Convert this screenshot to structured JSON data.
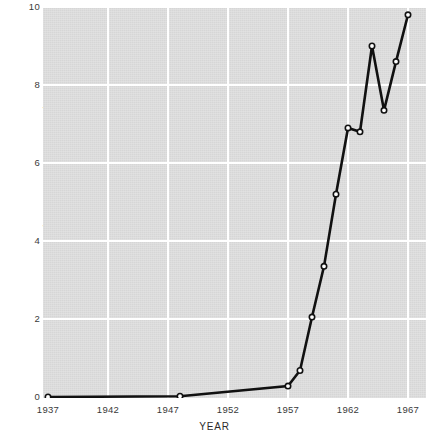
{
  "chart_data": {
    "type": "line",
    "title": "",
    "xlabel": "YEAR",
    "ylabel": "LIVE WEIGHT (MILLION METRIC TONS)",
    "xlim": [
      1937,
      1968
    ],
    "ylim": [
      0,
      10
    ],
    "xticks": [
      1937,
      1942,
      1947,
      1952,
      1957,
      1962,
      1967
    ],
    "xtick_labels": [
      "1937",
      "1942",
      "1947",
      "1952",
      "1957",
      "1962",
      "1967"
    ],
    "yticks": [
      0,
      2,
      4,
      6,
      8,
      10
    ],
    "ytick_labels": [
      "0",
      "2",
      "4",
      "6",
      "8",
      "10"
    ],
    "grid": true,
    "grid_color": "#ffffff",
    "plot_bg": "#dcdcdc",
    "line_color": "#111111",
    "marker": "open-circle",
    "marker_face_color": "#ffffff",
    "legend": "none",
    "x": [
      1937,
      1948,
      1957,
      1958,
      1959,
      1960,
      1961,
      1962,
      1963,
      1964,
      1965,
      1966,
      1967
    ],
    "values": [
      0.0,
      0.02,
      0.28,
      0.68,
      2.05,
      3.35,
      5.2,
      6.9,
      6.8,
      9.0,
      7.35,
      8.6,
      9.8
    ],
    "series": [
      {
        "name": "Live weight",
        "points": [
          {
            "x": 1937,
            "y": 0.0
          },
          {
            "x": 1948,
            "y": 0.02
          },
          {
            "x": 1957,
            "y": 0.28
          },
          {
            "x": 1958,
            "y": 0.68
          },
          {
            "x": 1959,
            "y": 2.05
          },
          {
            "x": 1960,
            "y": 3.35
          },
          {
            "x": 1961,
            "y": 5.2
          },
          {
            "x": 1962,
            "y": 6.9
          },
          {
            "x": 1963,
            "y": 6.8
          },
          {
            "x": 1964,
            "y": 9.0
          },
          {
            "x": 1965,
            "y": 7.35
          },
          {
            "x": 1966,
            "y": 8.6
          },
          {
            "x": 1967,
            "y": 9.8
          }
        ]
      }
    ]
  }
}
